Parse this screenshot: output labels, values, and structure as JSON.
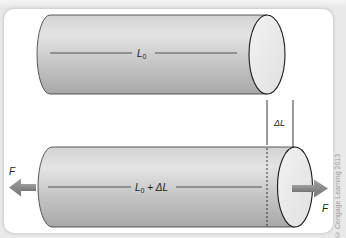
{
  "figure": {
    "top_cylinder": {
      "length_label_main": "L",
      "length_label_sub": "0"
    },
    "delta_marker": {
      "label_delta": "Δ",
      "label_L": "L"
    },
    "bottom_cylinder": {
      "length_label_main": "L",
      "length_label_sub": "0",
      "length_label_rest": " + ΔL",
      "force_left_label": "F",
      "force_right_label": "F"
    },
    "colors": {
      "cylinder_light": "#e4e4e4",
      "cylinder_mid": "#c4c4c4",
      "cylinder_dark": "#a9a9a9",
      "end_cap": "#ececec",
      "arrow": "#8a8a8a",
      "outline": "#222222"
    }
  },
  "copyright": "© Cengage Learning 2013"
}
